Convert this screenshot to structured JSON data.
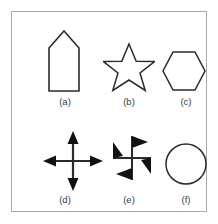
{
  "figure": {
    "background_color": "#ffffff",
    "frame_color": "#a9a9a9",
    "stroke_color": "#2b2b2b",
    "fill_color": "#ffffff",
    "label_color": "#3a3a3a",
    "panels": [
      {
        "id": "a",
        "label": "(a)",
        "shape_name": "house-pentagon",
        "style": "outline",
        "description": "Rectangle with a pointed triangular roof (home-plate pentagon), tall vertical orientation"
      },
      {
        "id": "b",
        "label": "(b)",
        "shape_name": "five-pointed-star",
        "style": "outline",
        "description": "Five pointed star outline"
      },
      {
        "id": "c",
        "label": "(c)",
        "shape_name": "hexagon",
        "style": "outline",
        "description": "Regular hexagon with pointed left and right vertices (flat top and bottom)"
      },
      {
        "id": "d",
        "label": "(d)",
        "shape_name": "four-way-cross-arrow",
        "style": "solid",
        "description": "Cross of two lines with solid triangular arrowheads on all four ends"
      },
      {
        "id": "e",
        "label": "(e)",
        "shape_name": "pinwheel-half-arrow-cross",
        "style": "solid",
        "description": "Cross of two lines with one-sided barbed half-arrowheads giving a pinwheel rotation appearance"
      },
      {
        "id": "f",
        "label": "(f)",
        "shape_name": "circle",
        "style": "outline",
        "description": "Plain circle outline"
      }
    ]
  }
}
